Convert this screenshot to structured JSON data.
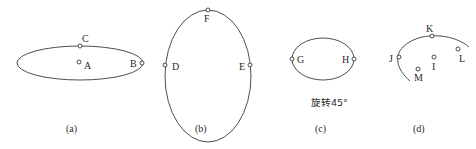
{
  "panels": [
    {
      "id": "a",
      "caption": "(a)",
      "shape": "ellipse",
      "points": [
        {
          "name": "A",
          "label": "A"
        },
        {
          "name": "B",
          "label": "B"
        },
        {
          "name": "C",
          "label": "C"
        }
      ]
    },
    {
      "id": "b",
      "caption": "(b)",
      "shape": "ellipse",
      "points": [
        {
          "name": "D",
          "label": "D"
        },
        {
          "name": "E",
          "label": "E"
        },
        {
          "name": "F",
          "label": "F"
        }
      ]
    },
    {
      "id": "c",
      "caption": "(c)",
      "shape": "ellipse",
      "note": "旋转45°",
      "points": [
        {
          "name": "G",
          "label": "G"
        },
        {
          "name": "H",
          "label": "H"
        }
      ]
    },
    {
      "id": "d",
      "caption": "(d)",
      "shape": "arc",
      "points": [
        {
          "name": "I",
          "label": "I"
        },
        {
          "name": "J",
          "label": "J"
        },
        {
          "name": "K",
          "label": "K"
        },
        {
          "name": "L",
          "label": "L"
        },
        {
          "name": "M",
          "label": "M"
        }
      ]
    }
  ],
  "colors": {
    "stroke": "#3a3a3a",
    "text": "#2a2a2a",
    "background": "#ffffff"
  }
}
